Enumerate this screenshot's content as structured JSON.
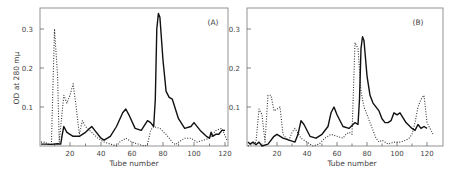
{
  "figure": {
    "ylabel": "OD at 280 mμ",
    "panels": [
      {
        "label": "(A)",
        "xlabel": "Tube number"
      },
      {
        "label": "(B)",
        "xlabel": "Tube number"
      }
    ],
    "xticks": [
      "20",
      "40",
      "60",
      "80",
      "100",
      "120"
    ],
    "yticks": [
      "0.1",
      "0.2",
      "0.3"
    ]
  },
  "chart_data": [
    {
      "type": "line",
      "title": "(A)",
      "xlabel": "Tube number",
      "ylabel": "OD at 280 mμ",
      "xlim": [
        0,
        124
      ],
      "ylim": [
        0,
        0.35
      ],
      "xticks": [
        20,
        40,
        60,
        80,
        100,
        120
      ],
      "yticks": [
        0.1,
        0.2,
        0.3
      ],
      "grid": false,
      "series": [
        {
          "name": "solid",
          "style": "solid",
          "x": [
            0,
            4,
            8,
            12,
            14,
            15,
            16,
            18,
            22,
            26,
            30,
            34,
            36,
            40,
            42,
            46,
            50,
            54,
            56,
            58,
            62,
            66,
            70,
            72,
            74,
            75,
            76,
            77,
            78,
            80,
            82,
            84,
            86,
            90,
            94,
            98,
            100,
            104,
            108,
            110,
            111,
            112,
            114,
            116,
            118,
            120
          ],
          "y": [
            0.005,
            0.005,
            0.004,
            0.006,
            0.005,
            0.03,
            0.05,
            0.035,
            0.025,
            0.025,
            0.035,
            0.05,
            0.04,
            0.02,
            0.015,
            0.025,
            0.05,
            0.085,
            0.095,
            0.08,
            0.045,
            0.04,
            0.065,
            0.06,
            0.05,
            0.12,
            0.3,
            0.34,
            0.33,
            0.22,
            0.14,
            0.125,
            0.12,
            0.07,
            0.045,
            0.05,
            0.06,
            0.04,
            0.025,
            0.02,
            0.035,
            0.025,
            0.03,
            0.03,
            0.04,
            0.04
          ]
        },
        {
          "name": "dotted",
          "style": "dotted",
          "x": [
            0,
            4,
            6,
            8,
            10,
            12,
            13,
            16,
            18,
            20,
            22,
            24,
            26,
            28,
            30,
            34,
            38,
            42,
            46,
            50,
            52,
            56,
            60,
            64,
            68,
            70,
            72,
            74,
            78,
            82,
            86,
            88,
            90,
            94,
            98,
            102,
            106,
            110,
            114,
            118,
            122
          ],
          "y": [
            0.01,
            0.01,
            0.005,
            0.005,
            0.3,
            0.18,
            0.01,
            0.13,
            0.11,
            0.13,
            0.16,
            0.1,
            0.03,
            0.065,
            0.05,
            0.035,
            0.02,
            0.01,
            0.005,
            0.0,
            0.01,
            0.02,
            0.01,
            0.005,
            0.0,
            0.005,
            0.04,
            0.05,
            0.045,
            0.03,
            0.01,
            0.003,
            0.01,
            0.02,
            0.02,
            0.01,
            0.015,
            0.02,
            0.04,
            0.045,
            0.015
          ]
        }
      ]
    },
    {
      "type": "line",
      "title": "(B)",
      "xlabel": "Tube number",
      "ylabel": "OD at 280 mμ",
      "xlim": [
        0,
        124
      ],
      "ylim": [
        0,
        0.35
      ],
      "xticks": [
        20,
        40,
        60,
        80,
        100,
        120
      ],
      "yticks": [
        0.1,
        0.2,
        0.3
      ],
      "grid": false,
      "series": [
        {
          "name": "solid",
          "style": "solid",
          "x": [
            0,
            2,
            4,
            6,
            8,
            10,
            14,
            18,
            20,
            24,
            28,
            32,
            34,
            36,
            38,
            42,
            46,
            50,
            54,
            56,
            58,
            60,
            64,
            68,
            72,
            74,
            75,
            76,
            77,
            78,
            80,
            82,
            84,
            88,
            90,
            92,
            94,
            96,
            98,
            100,
            102,
            106,
            110,
            112,
            114,
            116,
            118,
            120
          ],
          "y": [
            0.01,
            0.005,
            0.01,
            0.003,
            0.01,
            0.0,
            0.005,
            0.025,
            0.03,
            0.02,
            0.015,
            0.01,
            0.03,
            0.065,
            0.055,
            0.025,
            0.02,
            0.03,
            0.05,
            0.085,
            0.1,
            0.08,
            0.05,
            0.045,
            0.06,
            0.055,
            0.12,
            0.25,
            0.28,
            0.27,
            0.18,
            0.13,
            0.11,
            0.09,
            0.07,
            0.06,
            0.06,
            0.065,
            0.085,
            0.08,
            0.085,
            0.06,
            0.045,
            0.04,
            0.055,
            0.045,
            0.05,
            0.045
          ]
        },
        {
          "name": "dotted",
          "style": "dotted",
          "x": [
            0,
            4,
            6,
            8,
            10,
            12,
            14,
            16,
            18,
            20,
            22,
            24,
            26,
            28,
            30,
            32,
            36,
            40,
            44,
            48,
            52,
            56,
            60,
            64,
            66,
            68,
            70,
            72,
            74,
            76,
            78,
            82,
            86,
            88,
            90,
            94,
            98,
            102,
            106,
            108,
            110,
            112,
            114,
            116,
            118,
            120,
            124
          ],
          "y": [
            0.0,
            0.005,
            0.01,
            0.095,
            0.08,
            0.01,
            0.13,
            0.13,
            0.09,
            0.095,
            0.1,
            0.03,
            0.02,
            0.015,
            0.035,
            0.045,
            0.02,
            0.01,
            0.0,
            0.005,
            0.02,
            0.03,
            0.025,
            0.02,
            0.03,
            0.035,
            0.03,
            0.265,
            0.25,
            0.14,
            0.1,
            0.06,
            0.02,
            0.01,
            0.015,
            0.005,
            0.01,
            0.01,
            0.015,
            0.02,
            0.03,
            0.06,
            0.1,
            0.12,
            0.13,
            0.06,
            0.03
          ]
        }
      ]
    }
  ]
}
